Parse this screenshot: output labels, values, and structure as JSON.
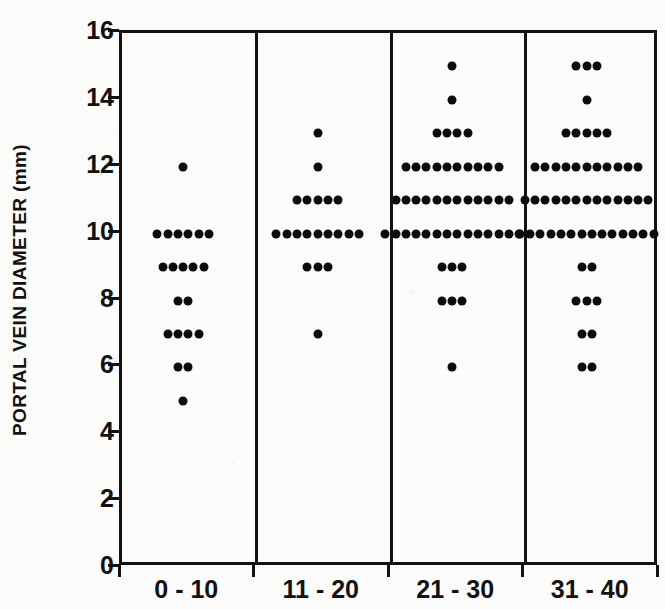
{
  "chart_data": {
    "type": "scatter",
    "title": "",
    "subtitle": "",
    "xlabel": "",
    "ylabel": "PORTAL VEIN DIAMETER (mm)",
    "ylim": [
      0,
      16
    ],
    "y_ticks": [
      0,
      2,
      4,
      6,
      8,
      10,
      12,
      14,
      16
    ],
    "y_tick_labels": [
      "0",
      "2",
      "4",
      "6",
      "8",
      "10",
      "12",
      "14",
      "16"
    ],
    "grid": false,
    "legend": null,
    "legend_position": "none",
    "categories": [
      "0 - 10",
      "11 - 20",
      "21 - 30",
      "31 - 40"
    ],
    "panels": [
      {
        "label": "0 - 10",
        "rows": [
          {
            "value": 12,
            "count": 1
          },
          {
            "value": 10,
            "count": 6
          },
          {
            "value": 9,
            "count": 5
          },
          {
            "value": 8,
            "count": 2
          },
          {
            "value": 7,
            "count": 4
          },
          {
            "value": 6,
            "count": 2
          },
          {
            "value": 5,
            "count": 1
          }
        ],
        "total": 21
      },
      {
        "label": "11 - 20",
        "rows": [
          {
            "value": 13,
            "count": 1
          },
          {
            "value": 12,
            "count": 1
          },
          {
            "value": 11,
            "count": 5
          },
          {
            "value": 10,
            "count": 9
          },
          {
            "value": 9,
            "count": 3
          },
          {
            "value": 7,
            "count": 1
          }
        ],
        "total": 20
      },
      {
        "label": "21 - 30",
        "rows": [
          {
            "value": 15,
            "count": 1
          },
          {
            "value": 14,
            "count": 1
          },
          {
            "value": 13,
            "count": 4
          },
          {
            "value": 12,
            "count": 10
          },
          {
            "value": 11,
            "count": 12
          },
          {
            "value": 10,
            "count": 14
          },
          {
            "value": 9,
            "count": 3
          },
          {
            "value": 8,
            "count": 3
          },
          {
            "value": 6,
            "count": 1
          }
        ],
        "total": 49
      },
      {
        "label": "31 - 40",
        "rows": [
          {
            "value": 15,
            "count": 3
          },
          {
            "value": 14,
            "count": 1
          },
          {
            "value": 13,
            "count": 5
          },
          {
            "value": 12,
            "count": 11
          },
          {
            "value": 11,
            "count": 13
          },
          {
            "value": 10,
            "count": 14
          },
          {
            "value": 9,
            "count": 2
          },
          {
            "value": 8,
            "count": 3
          },
          {
            "value": 7,
            "count": 2
          },
          {
            "value": 6,
            "count": 2
          }
        ],
        "total": 56
      }
    ],
    "colors": {
      "dot": "#0c0c0c",
      "axis": "#121212",
      "background": "#fbfbfa"
    }
  }
}
